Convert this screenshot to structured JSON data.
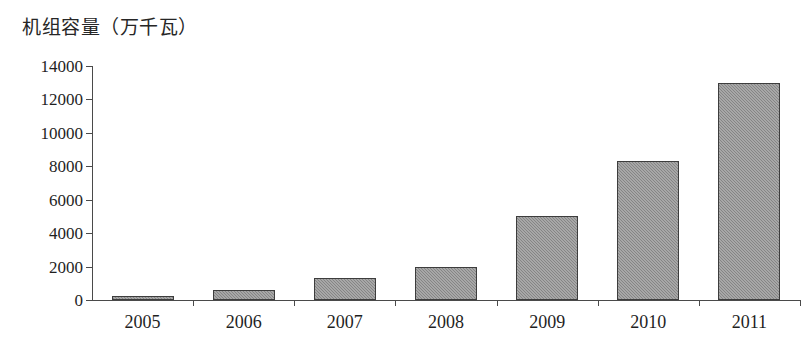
{
  "chart_data": {
    "type": "bar",
    "title": "机组容量（万千瓦）",
    "xlabel": "",
    "ylabel": "",
    "categories": [
      "2005",
      "2006",
      "2007",
      "2008",
      "2009",
      "2010",
      "2011"
    ],
    "values": [
      150,
      600,
      1300,
      2000,
      5000,
      8300,
      13000
    ],
    "series": [
      {
        "name": "机组容量",
        "values": [
          150,
          600,
          1300,
          2000,
          5000,
          8300,
          13000
        ]
      }
    ],
    "ylim": [
      0,
      14000
    ],
    "yticks": [
      0,
      2000,
      4000,
      6000,
      8000,
      10000,
      12000,
      14000
    ],
    "ytick_labels": [
      "0",
      "2000",
      "4000",
      "6000",
      "8000",
      "10000",
      "12000",
      "14000"
    ],
    "grid": false,
    "legend": null,
    "bar_color": "#8e8e8e",
    "bar_border_color": "#3d3d3d",
    "axis_color": "#4a4a4a",
    "text_color": "#1f1f1f",
    "background": "#ffffff"
  }
}
